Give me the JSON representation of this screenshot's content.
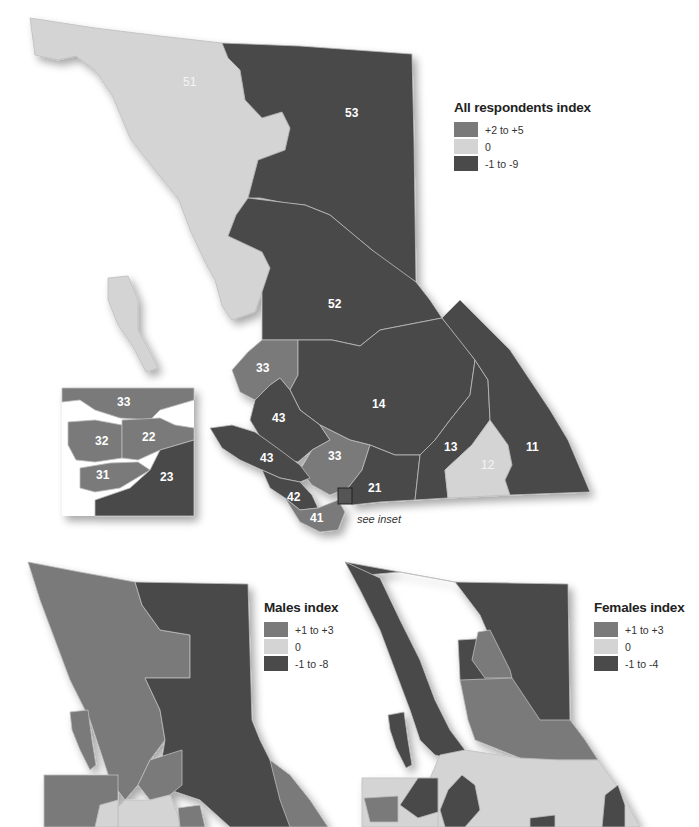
{
  "colors": {
    "positive": "#7a7a7a",
    "zero": "#d4d4d4",
    "negative": "#4a4a4a",
    "border": "#bdbdbd"
  },
  "main_map": {
    "legend": {
      "title": "All respondents index",
      "items": [
        {
          "label": "+2 to +5",
          "color": "#7a7a7a"
        },
        {
          "label": "0",
          "color": "#d4d4d4"
        },
        {
          "label": "-1 to -9",
          "color": "#4a4a4a"
        }
      ]
    },
    "regions": [
      {
        "id": "51",
        "category": "0"
      },
      {
        "id": "53",
        "category": "-1 to -9"
      },
      {
        "id": "52",
        "category": "-1 to -9"
      },
      {
        "id": "33",
        "category": "+2 to +5"
      },
      {
        "id": "43",
        "category": "-1 to -9"
      },
      {
        "id": "14",
        "category": "-1 to -9"
      },
      {
        "id": "13",
        "category": "-1 to -9"
      },
      {
        "id": "12",
        "category": "0"
      },
      {
        "id": "11",
        "category": "-1 to -9"
      },
      {
        "id": "21",
        "category": "-1 to -9"
      },
      {
        "id": "42",
        "category": "-1 to -9"
      },
      {
        "id": "41",
        "category": "+2 to +5"
      }
    ],
    "labels": {
      "r51": "51",
      "r53": "53",
      "r52": "52",
      "r33a": "33",
      "r43a": "43",
      "r43b": "43",
      "r14": "14",
      "r33b": "33",
      "r13": "13",
      "r12": "12",
      "r11": "11",
      "r21": "21",
      "r42": "42",
      "r41": "41"
    },
    "see_inset": "see inset",
    "inset": {
      "labels": {
        "r33": "33",
        "r32": "32",
        "r22": "22",
        "r31": "31",
        "r23": "23"
      },
      "regions": [
        {
          "id": "33",
          "category": "+2 to +5"
        },
        {
          "id": "32",
          "category": "+2 to +5"
        },
        {
          "id": "22",
          "category": "+2 to +5"
        },
        {
          "id": "31",
          "category": "+2 to +5"
        },
        {
          "id": "23",
          "category": "-1 to -9"
        }
      ]
    }
  },
  "males_map": {
    "legend": {
      "title": "Males index",
      "items": [
        {
          "label": "+1 to +3",
          "color": "#7a7a7a"
        },
        {
          "label": "0",
          "color": "#d4d4d4"
        },
        {
          "label": "-1 to -8",
          "color": "#4a4a4a"
        }
      ]
    }
  },
  "females_map": {
    "legend": {
      "title": "Females index",
      "items": [
        {
          "label": "+1 to +3",
          "color": "#7a7a7a"
        },
        {
          "label": "0",
          "color": "#d4d4d4"
        },
        {
          "label": "-1 to -4",
          "color": "#4a4a4a"
        }
      ]
    }
  }
}
